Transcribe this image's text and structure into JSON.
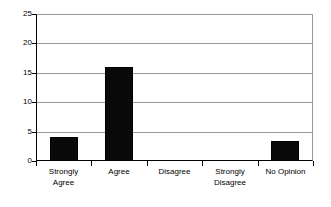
{
  "chart_data": {
    "type": "bar",
    "title": "",
    "subtitle": "",
    "xlabel": "",
    "ylabel": "",
    "categories": [
      "Strongly Agree",
      "Agree",
      "Disagree",
      "Strongly Disagree",
      "No Opinion"
    ],
    "category_lines": [
      [
        "Strongly",
        "Agree"
      ],
      [
        "Agree"
      ],
      [
        "Disagree"
      ],
      [
        "Strongly",
        "Disagree"
      ],
      [
        "No Opinion"
      ]
    ],
    "values": [
      4,
      16,
      0,
      0,
      3.4
    ],
    "series": [
      {
        "name": "Responses",
        "values": [
          4,
          16,
          0,
          0,
          3.4
        ]
      }
    ],
    "ylim": [
      0,
      25
    ],
    "yticks": [
      0,
      5,
      10,
      15,
      20,
      25
    ],
    "ytick_labels": [
      "0",
      "5",
      "10",
      "15",
      "20",
      "25"
    ],
    "grid": true,
    "grid_axis": "y",
    "legend": false,
    "legend_position": "none",
    "bar_color": "#0a0a0a",
    "gridline_color": "#9a9a9a",
    "axis_color": "#000000",
    "background_color": "#ffffff"
  }
}
